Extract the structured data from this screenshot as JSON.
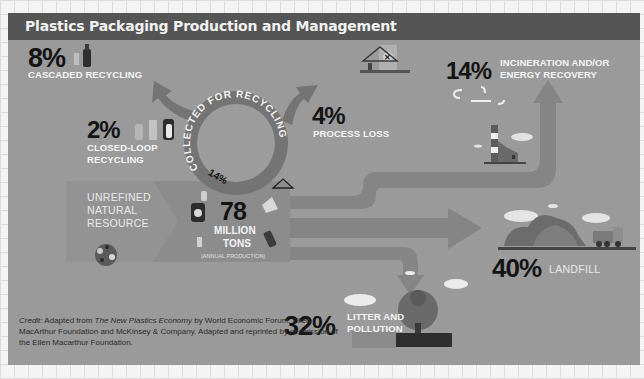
{
  "header": {
    "title": "Plastics Packaging Production and Management"
  },
  "center": {
    "value": "78",
    "unit_line1": "MILLION",
    "unit_line2": "TONS",
    "note": "(ANNUAL PRODUCTION)"
  },
  "source": {
    "line1": "UNREFINED",
    "line2": "NATURAL",
    "line3": "RESOURCE"
  },
  "recycling_ring": {
    "label": "COLLECTED FOR RECYCLING",
    "percent": "14%"
  },
  "outcomes": {
    "cascaded": {
      "percent": "8%",
      "label": "CASCADED RECYCLING"
    },
    "closed_loop": {
      "percent": "2%",
      "label_line1": "CLOSED-LOOP",
      "label_line2": "RECYCLING"
    },
    "process_loss": {
      "percent": "4%",
      "label": "PROCESS LOSS"
    },
    "incineration": {
      "percent": "14%",
      "label_line1": "INCINERATION AND/OR",
      "label_line2": "ENERGY RECOVERY"
    },
    "landfill": {
      "percent": "40%",
      "label": "LANDFILL"
    },
    "litter": {
      "percent": "32%",
      "label_line1": "LITTER AND",
      "label_line2": "POLLUTION"
    }
  },
  "credit": {
    "prefix": "Credit:",
    "text1": " Adapted from ",
    "book": "The New Plastics Economy",
    "text2": " by World Economic Forum, Ellen MacArthur Foundation and McKinsey & Company. Adapted and reprinted by permission of the Ellen Macarthur Foundation."
  },
  "colors": {
    "panel_bg": "#9a9a9a",
    "header_bg": "#555555",
    "flow_band": "#838383",
    "ring": "#777777",
    "text_dark": "#141414",
    "text_light": "#f4f4f4"
  }
}
